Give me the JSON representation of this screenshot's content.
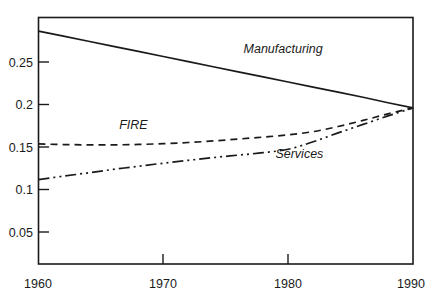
{
  "chart_data": {
    "type": "line",
    "title": "",
    "subtitle": "",
    "xlabel": "",
    "ylabel": "",
    "xlim": [
      1960,
      1990
    ],
    "ylim": [
      0.0,
      0.2905
    ],
    "grid": false,
    "legend_position": "inline-labels",
    "x_ticks": [
      "1960",
      "1970",
      "1980",
      "1990"
    ],
    "x_tick_values": [
      1960,
      1970,
      1980,
      1990
    ],
    "y_ticks": [
      "0.05",
      "0.1",
      "0.15",
      "0.2",
      "0.25"
    ],
    "y_tick_values": [
      0.05,
      0.1,
      0.15,
      0.2,
      0.25
    ],
    "x": [
      1960,
      1962,
      1964,
      1966,
      1968,
      1970,
      1972,
      1974,
      1976,
      1978,
      1980,
      1982,
      1984,
      1986,
      1988,
      1990
    ],
    "series": [
      {
        "name": "Manufacturing",
        "style": "solid",
        "color": "#1a1a1a",
        "values": [
          0.2745,
          0.2685,
          0.2625,
          0.2565,
          0.2505,
          0.2445,
          0.2385,
          0.2325,
          0.2265,
          0.2205,
          0.2145,
          0.2085,
          0.2025,
          0.1965,
          0.19,
          0.184
        ]
      },
      {
        "name": "FIRE",
        "style": "dashed",
        "color": "#1a1a1a",
        "values": [
          0.1415,
          0.1408,
          0.1404,
          0.1404,
          0.1409,
          0.1418,
          0.1432,
          0.145,
          0.1472,
          0.1496,
          0.1522,
          0.156,
          0.162,
          0.1692,
          0.177,
          0.184
        ]
      },
      {
        "name": "Services",
        "style": "dash-dot-dot",
        "color": "#1a1a1a",
        "values": [
          0.0995,
          0.1035,
          0.1075,
          0.1115,
          0.1152,
          0.1188,
          0.1222,
          0.1254,
          0.1283,
          0.1312,
          0.1352,
          0.144,
          0.1545,
          0.1645,
          0.1745,
          0.184
        ]
      }
    ],
    "annotations": [
      {
        "text": "Manufacturing",
        "x": 1979.6,
        "y": 0.2485,
        "series": "Manufacturing"
      },
      {
        "text": "FIRE",
        "x": 1967.6,
        "y": 0.1592,
        "series": "FIRE"
      },
      {
        "text": "Services",
        "x": 1980.9,
        "y": 0.1245,
        "series": "Services"
      }
    ]
  },
  "colors": {
    "background": "#ffffff",
    "axis": "#1a1a1a",
    "text": "#1a1a1a"
  }
}
